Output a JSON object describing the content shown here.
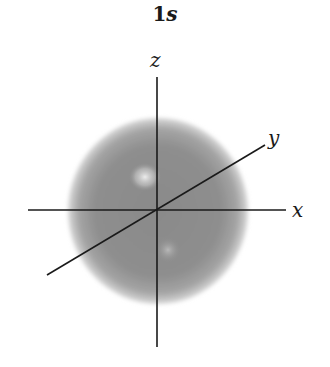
{
  "title": {
    "number": "1",
    "letter": "s"
  },
  "axes": {
    "z_label": "z",
    "y_label": "y",
    "x_label": "x"
  },
  "colors": {
    "sphere_edge": "#bdbdbd",
    "sphere_mid": "#8c8c8c",
    "highlight": "#e8e8e8",
    "axis": "#1a1a1a"
  }
}
